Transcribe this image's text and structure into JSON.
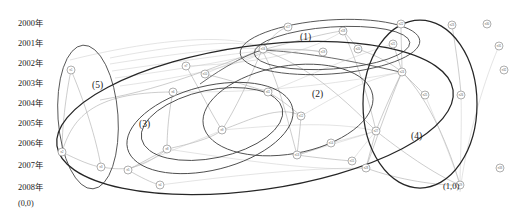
{
  "figure": {
    "title": "",
    "background_color": "#ffffff",
    "width": 524,
    "height": 215
  },
  "axis": {
    "name": "year-axis",
    "orientation": "vertical",
    "origin_label": "(0,0)",
    "ticks": [
      {
        "label": "2000年",
        "y": 24
      },
      {
        "label": "2001年",
        "y": 44
      },
      {
        "label": "2002年",
        "y": 64
      },
      {
        "label": "2003年",
        "y": 84
      },
      {
        "label": "2004年",
        "y": 104
      },
      {
        "label": "2005年",
        "y": 124
      },
      {
        "label": "2006年",
        "y": 144
      },
      {
        "label": "2007年",
        "y": 166
      },
      {
        "label": "2008年",
        "y": 188
      }
    ]
  },
  "annotations": [
    {
      "name": "cluster-label-1",
      "text": "(1)",
      "x": 300,
      "y": 40
    },
    {
      "name": "cluster-label-2",
      "text": "(2)",
      "x": 312,
      "y": 97
    },
    {
      "name": "cluster-label-3",
      "text": "(3)",
      "x": 139,
      "y": 127
    },
    {
      "name": "cluster-label-4",
      "text": "(4)",
      "x": 411,
      "y": 139
    },
    {
      "name": "cluster-label-5",
      "text": "(5)",
      "x": 92,
      "y": 88
    },
    {
      "name": "corner-coordinate-label",
      "text": "(1,0)",
      "x": 443,
      "y": 189
    }
  ],
  "chart_data": {
    "type": "scatter",
    "title": "",
    "xlabel": "",
    "ylabel": "年 (Year)",
    "grid": false,
    "legend": "none",
    "clusters": [
      {
        "id": "1",
        "label": "(1)",
        "member_count": 7
      },
      {
        "id": "2",
        "label": "(2)",
        "member_count": 9
      },
      {
        "id": "3",
        "label": "(3)",
        "member_count": 8
      },
      {
        "id": "4",
        "label": "(4)",
        "member_count": 9
      },
      {
        "id": "5",
        "label": "(5)",
        "member_count": 3
      }
    ],
    "nodes": [
      {
        "id": "n01",
        "label": "n1",
        "x": 71,
        "y": 70,
        "cluster": "5"
      },
      {
        "id": "n02",
        "label": "n2",
        "x": 62,
        "y": 152,
        "cluster": "5"
      },
      {
        "id": "n03",
        "label": "n3",
        "x": 101,
        "y": 167,
        "cluster": "5"
      },
      {
        "id": "n04",
        "label": "n4",
        "x": 160,
        "y": 185,
        "cluster": "3"
      },
      {
        "id": "n05",
        "label": "n5",
        "x": 128,
        "y": 170,
        "cluster": "3"
      },
      {
        "id": "n06",
        "label": "n6",
        "x": 173,
        "y": 92,
        "cluster": "3"
      },
      {
        "id": "n07",
        "label": "n7",
        "x": 186,
        "y": 66,
        "cluster": "3"
      },
      {
        "id": "n08",
        "label": "n8",
        "x": 167,
        "y": 149,
        "cluster": "3"
      },
      {
        "id": "n09",
        "label": "n9",
        "x": 222,
        "y": 130,
        "cluster": "3"
      },
      {
        "id": "n10",
        "label": "n10",
        "x": 205,
        "y": 74,
        "cluster": "2"
      },
      {
        "id": "n11",
        "label": "n11",
        "x": 268,
        "y": 92,
        "cluster": "2"
      },
      {
        "id": "n12",
        "label": "n12",
        "x": 301,
        "y": 116,
        "cluster": "2"
      },
      {
        "id": "n13",
        "label": "n13",
        "x": 297,
        "y": 155,
        "cluster": "2"
      },
      {
        "id": "n14",
        "label": "n14",
        "x": 331,
        "y": 143,
        "cluster": "2"
      },
      {
        "id": "n15",
        "label": "n15",
        "x": 352,
        "y": 161,
        "cluster": "2"
      },
      {
        "id": "n16",
        "label": "n16",
        "x": 263,
        "y": 49,
        "cluster": "1"
      },
      {
        "id": "n17",
        "label": "n17",
        "x": 288,
        "y": 27,
        "cluster": "1"
      },
      {
        "id": "n18",
        "label": "n18",
        "x": 343,
        "y": 31,
        "cluster": "1"
      },
      {
        "id": "n19",
        "label": "n19",
        "x": 323,
        "y": 52,
        "cluster": "1"
      },
      {
        "id": "n20",
        "label": "n20",
        "x": 358,
        "y": 49,
        "cluster": "1"
      },
      {
        "id": "n21",
        "label": "n21",
        "x": 393,
        "y": 44,
        "cluster": "1"
      },
      {
        "id": "n22",
        "label": "n22",
        "x": 401,
        "y": 24,
        "cluster": "4"
      },
      {
        "id": "n23",
        "label": "n23",
        "x": 452,
        "y": 25,
        "cluster": "4"
      },
      {
        "id": "n24",
        "label": "n24",
        "x": 402,
        "y": 72,
        "cluster": "4"
      },
      {
        "id": "n25",
        "label": "n25",
        "x": 425,
        "y": 95,
        "cluster": "4"
      },
      {
        "id": "n26",
        "label": "n26",
        "x": 461,
        "y": 95,
        "cluster": "4"
      },
      {
        "id": "n27",
        "label": "n27",
        "x": 376,
        "y": 131,
        "cluster": "4"
      },
      {
        "id": "n28",
        "label": "n28",
        "x": 366,
        "y": 168,
        "cluster": "4"
      },
      {
        "id": "n29",
        "label": "n29",
        "x": 460,
        "y": 185,
        "cluster": "4"
      },
      {
        "id": "n30",
        "label": "n30",
        "x": 487,
        "y": 24,
        "isolated": true
      },
      {
        "id": "n31",
        "label": "n31",
        "x": 499,
        "y": 46,
        "isolated": true
      },
      {
        "id": "n32",
        "label": "n32",
        "x": 504,
        "y": 70,
        "isolated": true
      },
      {
        "id": "n33",
        "label": "n33",
        "x": 500,
        "y": 168,
        "isolated": true
      }
    ],
    "edges": [
      {
        "from": "n01",
        "to": "n02"
      },
      {
        "from": "n01",
        "to": "n03"
      },
      {
        "from": "n02",
        "to": "n03"
      },
      {
        "from": "n05",
        "to": "n04"
      },
      {
        "from": "n05",
        "to": "n03"
      },
      {
        "from": "n06",
        "to": "n08"
      },
      {
        "from": "n07",
        "to": "n09"
      },
      {
        "from": "n10",
        "to": "n11"
      },
      {
        "from": "n11",
        "to": "n12"
      },
      {
        "from": "n12",
        "to": "n13"
      },
      {
        "from": "n13",
        "to": "n15"
      },
      {
        "from": "n16",
        "to": "n17"
      },
      {
        "from": "n16",
        "to": "n19"
      },
      {
        "from": "n18",
        "to": "n20"
      },
      {
        "from": "n21",
        "to": "n24"
      },
      {
        "from": "n22",
        "to": "n24"
      },
      {
        "from": "n24",
        "to": "n25"
      },
      {
        "from": "n24",
        "to": "n27"
      },
      {
        "from": "n27",
        "to": "n28"
      },
      {
        "from": "n23",
        "to": "n26"
      },
      {
        "from": "n24",
        "to": "n29"
      }
    ]
  }
}
